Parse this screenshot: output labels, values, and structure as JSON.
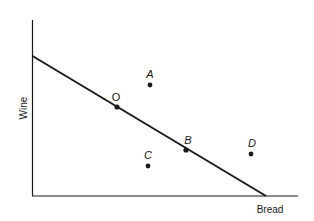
{
  "diagram": {
    "type": "budget-line",
    "axes": {
      "x_label": "Bread",
      "y_label": "Wine"
    },
    "budget_line": {
      "from": "y-intercept",
      "to": "x-intercept"
    },
    "points": [
      {
        "id": "O",
        "label": "O",
        "on_line": true
      },
      {
        "id": "A",
        "label": "A",
        "on_line": false,
        "position": "above line"
      },
      {
        "id": "B",
        "label": "B",
        "on_line": true
      },
      {
        "id": "C",
        "label": "C",
        "on_line": false,
        "position": "below line"
      },
      {
        "id": "D",
        "label": "D",
        "on_line": false,
        "position": "above line"
      }
    ],
    "colors": {
      "ink": "#1a1a1a",
      "background": "#ffffff"
    }
  }
}
